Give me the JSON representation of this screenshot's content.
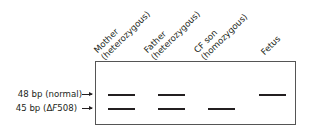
{
  "lanes": [
    {
      "name": "Mother",
      "genotype": "(heterozygous)",
      "bands": [
        "48 bp",
        "45 bp"
      ]
    },
    {
      "name": "Father",
      "genotype": "(heterozygous)",
      "bands": [
        "48 bp",
        "45 bp"
      ]
    },
    {
      "name": "CF son",
      "genotype": "(homozygous)",
      "bands": [
        "45 bp"
      ]
    },
    {
      "name": "Fetus",
      "genotype": "",
      "bands": [
        "48 bp"
      ]
    }
  ],
  "size_markers": [
    {
      "label": "48 bp (normal)"
    },
    {
      "label_prefix": "45 bp (",
      "label_delta": "Δ",
      "label_italic": "F",
      "label_suffix": "508)"
    }
  ],
  "colors": {
    "band": "#231f20",
    "border": "#555555",
    "background": "#ffffff"
  }
}
